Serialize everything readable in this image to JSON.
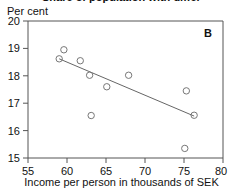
{
  "figure": {
    "title_cropped": "Share of population with different incomes",
    "panel_label": "B",
    "ylabel": "Per cent",
    "xlabel": "Income per person in thousands of SEK"
  },
  "axes": {
    "x_ticks": [
      "55",
      "60",
      "65",
      "70",
      "75",
      "80"
    ],
    "y_ticks": [
      "15",
      "16",
      "17",
      "18",
      "19",
      "20"
    ]
  },
  "colors": {
    "axis": "#555555",
    "marker": "#777777",
    "trend": "#666666",
    "text": "#111111",
    "background": "#ffffff"
  },
  "chart_data": {
    "type": "scatter",
    "title": "Share of population with different incomes",
    "xlabel": "Income per person in thousands of SEK",
    "ylabel": "Per cent",
    "xlim": [
      55,
      80
    ],
    "ylim": [
      15,
      20
    ],
    "xticks": [
      55,
      60,
      65,
      70,
      75,
      80
    ],
    "yticks": [
      15,
      16,
      17,
      18,
      19,
      20
    ],
    "grid": false,
    "legend": false,
    "annotations": [
      "B"
    ],
    "points": [
      {
        "x": 59.0,
        "y": 18.62
      },
      {
        "x": 59.6,
        "y": 18.95
      },
      {
        "x": 61.7,
        "y": 18.55
      },
      {
        "x": 62.9,
        "y": 18.02
      },
      {
        "x": 63.1,
        "y": 16.55
      },
      {
        "x": 65.1,
        "y": 17.6
      },
      {
        "x": 67.9,
        "y": 18.02
      },
      {
        "x": 75.1,
        "y": 15.35
      },
      {
        "x": 75.3,
        "y": 17.45
      },
      {
        "x": 76.3,
        "y": 16.56
      }
    ],
    "series": [
      {
        "name": "observations",
        "x": [
          59.0,
          59.6,
          61.7,
          62.9,
          63.1,
          65.1,
          67.9,
          75.1,
          75.3,
          76.3
        ],
        "values": [
          18.62,
          18.95,
          18.55,
          18.02,
          16.55,
          17.6,
          18.02,
          15.35,
          17.45,
          16.56
        ]
      },
      {
        "name": "trend-line",
        "type": "line",
        "x": [
          59.0,
          76.3
        ],
        "values": [
          18.62,
          16.53
        ]
      }
    ]
  }
}
